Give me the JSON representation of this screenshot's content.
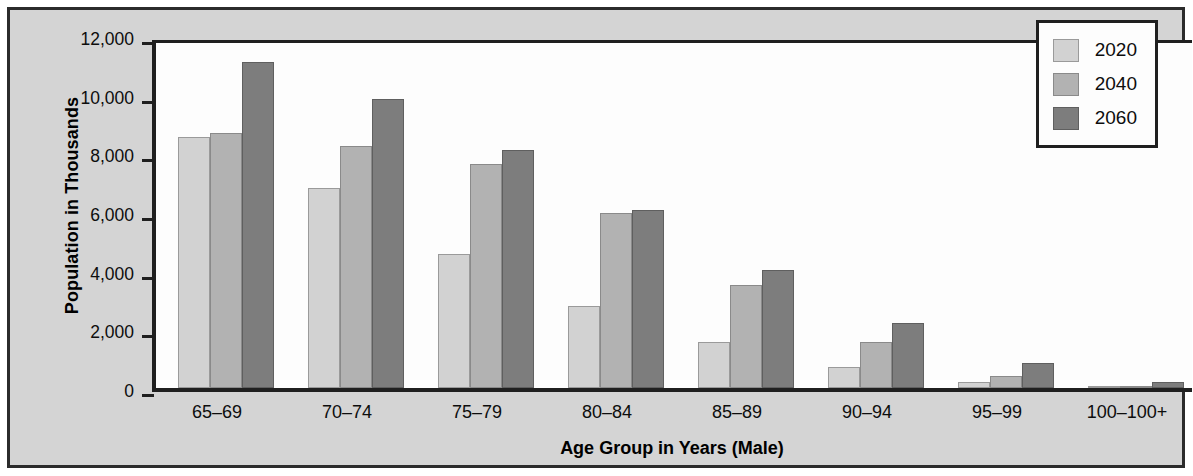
{
  "chart_data": {
    "type": "bar",
    "title": "",
    "xlabel": "Age Group in Years (Male)",
    "ylabel": "Population in Thousands",
    "categories": [
      "65–69",
      "70–74",
      "75–79",
      "80–84",
      "85–89",
      "90–94",
      "95–99",
      "100–100+"
    ],
    "series": [
      {
        "name": "2020",
        "color": "#d2d2d2",
        "values": [
          8550,
          6830,
          4560,
          2790,
          1570,
          730,
          200,
          30
        ]
      },
      {
        "name": "2040",
        "color": "#b2b2b2",
        "values": [
          8680,
          8250,
          7650,
          5950,
          3520,
          1560,
          420,
          70
        ]
      },
      {
        "name": "2060",
        "color": "#7d7d7d",
        "values": [
          11100,
          9840,
          8120,
          6060,
          4030,
          2220,
          840,
          210
        ]
      }
    ],
    "ylim": [
      0,
      12000
    ],
    "yticks": [
      0,
      2000,
      4000,
      6000,
      8000,
      10000,
      12000
    ],
    "ytick_labels": [
      "0",
      "2,000",
      "4,000",
      "6,000",
      "8,000",
      "10,000",
      "12,000"
    ],
    "grid": false,
    "legend_position": "top-right",
    "legend_entries": [
      "2020",
      "2040",
      "2060"
    ]
  },
  "figure": {
    "background_color": "#d4d4d4",
    "plot_background_color": "#fdfdfd",
    "frame_color": "#2b2b2b",
    "axis_color": "#1f1f1f"
  }
}
